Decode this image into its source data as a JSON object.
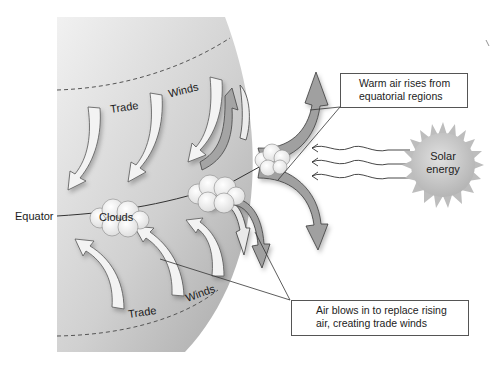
{
  "diagram": {
    "type": "trade-winds-formation",
    "labels": {
      "equator": "Equator",
      "clouds": "Clouds",
      "trade_upper": "Trade",
      "winds_upper": "Winds",
      "trade_lower": "Trade",
      "winds_lower": "Winds"
    },
    "sun": {
      "line1": "Solar",
      "line2": "energy"
    },
    "callouts": {
      "warm_air": {
        "line1": "Warm air rises from",
        "line2": "equatorial regions"
      },
      "trade_winds": {
        "line1": "Air blows in to replace rising",
        "line2": "air, creating trade winds"
      }
    },
    "colors": {
      "globe_light": "#e8e8e8",
      "globe_dark": "#a9a9a9",
      "arrow_light": "#f2f2f2",
      "arrow_dark": "#9a9a9a",
      "sun": "#c4c4c4",
      "outline": "#444444"
    }
  }
}
